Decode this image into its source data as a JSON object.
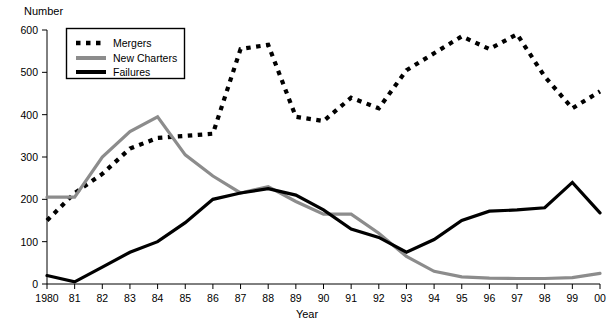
{
  "chart_data": {
    "type": "line",
    "title": "",
    "xlabel": "Year",
    "ylabel": "Number",
    "x": [
      1980,
      1981,
      1982,
      1983,
      1984,
      1985,
      1986,
      1987,
      1988,
      1989,
      1990,
      1991,
      1992,
      1993,
      1994,
      1995,
      1996,
      1997,
      1998,
      1999,
      2000
    ],
    "tick_labels": [
      "1980",
      "81",
      "82",
      "83",
      "84",
      "85",
      "86",
      "87",
      "88",
      "89",
      "90",
      "91",
      "92",
      "93",
      "94",
      "95",
      "96",
      "97",
      "98",
      "99",
      "00"
    ],
    "ylim": [
      0,
      600
    ],
    "yticks": [
      0,
      100,
      200,
      300,
      400,
      500,
      600
    ],
    "ytick_labels": [
      "0",
      "100",
      "200",
      "300",
      "400",
      "500",
      "600"
    ],
    "grid": false,
    "legend_position": "top-left",
    "series": [
      {
        "name": "Mergers",
        "style": "dotted",
        "color": "#000000",
        "values": [
          150,
          215,
          260,
          320,
          345,
          350,
          355,
          555,
          565,
          395,
          385,
          440,
          415,
          505,
          545,
          585,
          555,
          590,
          490,
          415,
          455
        ]
      },
      {
        "name": "New Charters",
        "style": "solid",
        "color": "#8c8c8c",
        "values": [
          205,
          205,
          300,
          360,
          395,
          305,
          255,
          215,
          230,
          195,
          165,
          165,
          120,
          65,
          30,
          17,
          14,
          13,
          13,
          15,
          25
        ]
      },
      {
        "name": "Failures",
        "style": "solid",
        "color": "#000000",
        "values": [
          20,
          5,
          40,
          75,
          100,
          145,
          200,
          215,
          225,
          210,
          175,
          130,
          110,
          75,
          105,
          150,
          172,
          175,
          180,
          240,
          168
        ]
      }
    ]
  },
  "legend": {
    "entries": [
      {
        "label": "Mergers"
      },
      {
        "label": "New Charters"
      },
      {
        "label": "Failures"
      }
    ]
  },
  "axes": {
    "y_axis_title": "Number",
    "x_axis_title": "Year"
  }
}
